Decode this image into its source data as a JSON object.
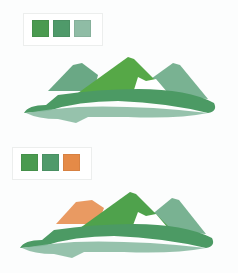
{
  "palettes": [
    {
      "name": "green-palette",
      "swatches": [
        {
          "color": "#4a9a4f"
        },
        {
          "color": "#4f9a6a"
        },
        {
          "color": "#8fbca5"
        }
      ]
    },
    {
      "name": "green-orange-palette",
      "swatches": [
        {
          "color": "#4a9a4f"
        },
        {
          "color": "#4f9a6a"
        },
        {
          "color": "#e58a47"
        }
      ]
    }
  ],
  "illustrations": [
    {
      "name": "mountain-logo-green",
      "colors": {
        "left_peak": "#5a9f78",
        "center_peak": "#56a847",
        "right_peak": "#6aaa86",
        "ridge": "#4c9a64",
        "water": "#8bbba3"
      }
    },
    {
      "name": "mountain-logo-orange",
      "colors": {
        "left_peak": "#e8955a",
        "center_peak": "#4fa24c",
        "right_peak": "#6aaa86",
        "ridge": "#4c9a64",
        "water": "#8bbba3"
      }
    }
  ]
}
